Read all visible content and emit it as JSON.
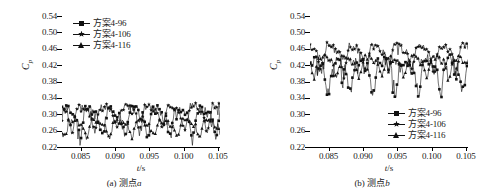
{
  "figure": {
    "background": "#ffffff",
    "line_color": "#111111"
  },
  "chart_data": [
    {
      "type": "line",
      "panel": "a",
      "title": "",
      "caption_prefix": "(a) 测点",
      "caption_italic": "a",
      "xlabel_symbol": "t",
      "xlabel_unit": "/s",
      "ylabel_symbol": "C",
      "ylabel_sub": "p",
      "xlim": [
        0.0823,
        0.1053
      ],
      "ylim": [
        0.22,
        0.54
      ],
      "xticks": [
        "0.085",
        "0.090",
        "0.095",
        "0.100",
        "0.105"
      ],
      "xtick_values": [
        0.085,
        0.09,
        0.095,
        0.1,
        0.105
      ],
      "yticks": [
        "0.22",
        "0.26",
        "0.30",
        "0.34",
        "0.38",
        "0.42",
        "0.46",
        "0.50",
        "0.54"
      ],
      "ytick_values": [
        0.22,
        0.26,
        0.3,
        0.34,
        0.38,
        0.42,
        0.46,
        0.5,
        0.54
      ],
      "grid": false,
      "legend_position": "top-left",
      "cycles": 7,
      "series": [
        {
          "name": "方案4-96",
          "marker": "square",
          "mean": 0.292,
          "amplitude": 0.042,
          "noise": 0.022,
          "phase": 0.0
        },
        {
          "name": "方案4-106",
          "marker": "star",
          "mean": 0.3,
          "amplitude": 0.038,
          "noise": 0.02,
          "phase": 0.35
        },
        {
          "name": "方案4-116",
          "marker": "triangle",
          "mean": 0.272,
          "amplitude": 0.026,
          "noise": 0.014,
          "phase": 0.7
        }
      ]
    },
    {
      "type": "line",
      "panel": "b",
      "title": "",
      "caption_prefix": "(b) 测点",
      "caption_italic": "b",
      "xlabel_symbol": "t",
      "xlabel_unit": "/s",
      "ylabel_symbol": "C",
      "ylabel_sub": "p",
      "xlim": [
        0.0823,
        0.1053
      ],
      "ylim": [
        0.22,
        0.54
      ],
      "xticks": [
        "0.085",
        "0.090",
        "0.095",
        "0.100",
        "0.105"
      ],
      "xtick_values": [
        0.085,
        0.09,
        0.095,
        0.1,
        0.105
      ],
      "yticks": [
        "0.22",
        "0.26",
        "0.30",
        "0.34",
        "0.38",
        "0.42",
        "0.46",
        "0.50",
        "0.54"
      ],
      "ytick_values": [
        0.22,
        0.26,
        0.3,
        0.34,
        0.38,
        0.42,
        0.46,
        0.5,
        0.54
      ],
      "grid": false,
      "legend_position": "bottom-right",
      "cycles": 7,
      "series": [
        {
          "name": "方案4-96",
          "marker": "square",
          "mean": 0.408,
          "amplitude": 0.052,
          "noise": 0.03,
          "phase": 0.0
        },
        {
          "name": "方案4-106",
          "marker": "star",
          "mean": 0.448,
          "amplitude": 0.04,
          "noise": 0.018,
          "phase": 0.3
        },
        {
          "name": "方案4-116",
          "marker": "triangle",
          "mean": 0.424,
          "amplitude": 0.03,
          "noise": 0.016,
          "phase": 0.62
        }
      ]
    }
  ]
}
